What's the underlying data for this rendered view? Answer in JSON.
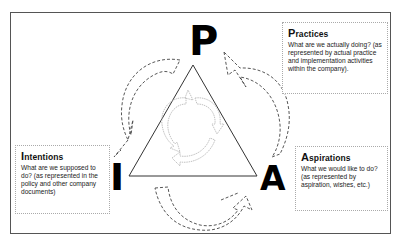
{
  "diagram": {
    "letters": {
      "top": "P",
      "left": "I",
      "right": "A"
    },
    "boxes": {
      "practices": {
        "title_cap": "P",
        "title_rest": "ractices",
        "text": "What are we actually doing? (as represented by actual practice and implementation activities within the company)."
      },
      "intentions": {
        "title_cap": "I",
        "title_rest": "ntentions",
        "text": "What are we supposed to do? (as represented in the policy and other company documents)"
      },
      "aspirations": {
        "title_cap": "A",
        "title_rest": "spirations",
        "text": "What we would like to do? (as represented by aspiration, wishes, etc.)"
      }
    },
    "colors": {
      "frame": "#555555",
      "triangle": "#333333",
      "dashed_arrows": "#444444",
      "inner_cycle": "#bbbbbb",
      "box_border": "#aaaaaa"
    }
  }
}
